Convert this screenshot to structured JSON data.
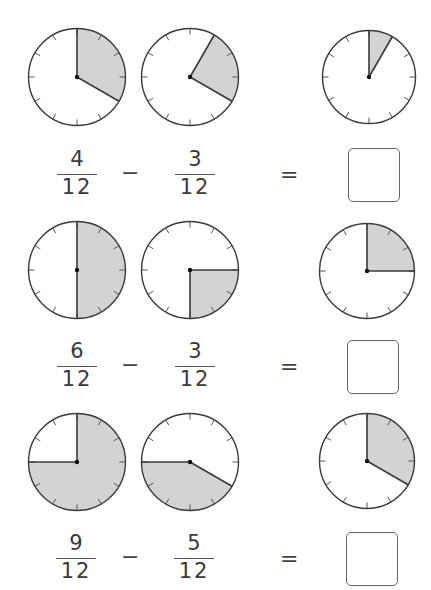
{
  "worksheet": {
    "shade_color": "#d3d3d3",
    "outline_color": "#3a3a3a",
    "problems": [
      {
        "clocks": [
          {
            "filled_twelfths": 4,
            "start": 0
          },
          {
            "filled_twelfths": 3,
            "start": 1
          },
          {
            "filled_twelfths": 1,
            "start": 0
          }
        ],
        "left": {
          "numerator": "4",
          "denominator": "12"
        },
        "operator": "−",
        "right": {
          "numerator": "3",
          "denominator": "12"
        },
        "equals": "=",
        "answer": ""
      },
      {
        "clocks": [
          {
            "filled_twelfths": 6,
            "start": 0
          },
          {
            "filled_twelfths": 3,
            "start": 3
          },
          {
            "filled_twelfths": 3,
            "start": 0
          }
        ],
        "left": {
          "numerator": "6",
          "denominator": "12"
        },
        "operator": "−",
        "right": {
          "numerator": "3",
          "denominator": "12"
        },
        "equals": "=",
        "answer": ""
      },
      {
        "clocks": [
          {
            "filled_twelfths": 9,
            "start": 0
          },
          {
            "filled_twelfths": 5,
            "start": 4
          },
          {
            "filled_twelfths": 4,
            "start": 0
          }
        ],
        "left": {
          "numerator": "9",
          "denominator": "12"
        },
        "operator": "−",
        "right": {
          "numerator": "5",
          "denominator": "12"
        },
        "equals": "=",
        "answer": ""
      }
    ]
  }
}
